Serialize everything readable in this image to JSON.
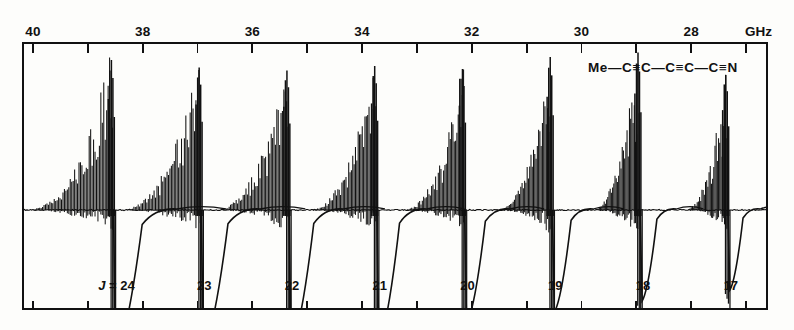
{
  "figure": {
    "kind": "microwave-rotational-spectrum",
    "species_formula": "Me—C≡C—C≡C—C≡N",
    "unit_label": "GHz",
    "j_prefix": "J =",
    "ink_color": "#111111",
    "background_color": "#fdfdfb"
  },
  "chart_data": {
    "type": "line",
    "title": "",
    "subtitle": "",
    "xlabel": "GHz",
    "ylabel": "",
    "grid": false,
    "legend": null,
    "annotations": [
      {
        "text": "Me—C≡C—C≡C—C≡N",
        "x": 28.6,
        "y": 0.9
      }
    ],
    "x_axis": {
      "orientation": "top",
      "direction": "decreasing",
      "range": [
        40.2,
        26.6
      ],
      "minor_tick_step": 1,
      "major_tick_step": 2,
      "tick_values": [
        40,
        39,
        38,
        37,
        36,
        35,
        34,
        33,
        32,
        31,
        30,
        29,
        28,
        27
      ],
      "labeled_ticks": [
        40,
        38,
        36,
        34,
        32,
        30,
        28
      ],
      "tick_labels": [
        "40",
        "38",
        "36",
        "34",
        "32",
        "30",
        "28"
      ]
    },
    "y_axis": {
      "range": [
        -1.15,
        1.05
      ],
      "ticks": [],
      "tick_labels": []
    },
    "bottom_axis": {
      "orientation": "bottom",
      "tick_values": [
        40,
        39,
        38,
        37,
        36,
        35,
        34,
        33,
        32,
        31,
        30,
        29,
        28,
        27
      ],
      "labels": [
        "24",
        "23",
        "22",
        "21",
        "20",
        "19",
        "18",
        "17",
        "16"
      ],
      "label_prefix_first": "J ="
    },
    "series": [
      {
        "name": "absorption trace",
        "description": "Nine J-transition clusters; each is a dense comb of K-structure lines rising to a tall peak followed by a sharp negative lobe.",
        "clusters": [
          {
            "j": 24,
            "label": "24",
            "center_ghz": 38.55,
            "peak_height": 1.0,
            "dip_depth": -1.05,
            "comb_width_ghz": 1.62,
            "n_lines": 62
          },
          {
            "j": 23,
            "label": "23",
            "center_ghz": 36.95,
            "peak_height": 0.95,
            "dip_depth": -1.0,
            "comb_width_ghz": 1.5,
            "n_lines": 58
          },
          {
            "j": 22,
            "label": "22",
            "center_ghz": 35.35,
            "peak_height": 0.93,
            "dip_depth": -0.98,
            "comb_width_ghz": 1.38,
            "n_lines": 55
          },
          {
            "j": 21,
            "label": "21",
            "center_ghz": 33.75,
            "peak_height": 0.96,
            "dip_depth": -0.95,
            "comb_width_ghz": 1.26,
            "n_lines": 52
          },
          {
            "j": 20,
            "label": "20",
            "center_ghz": 32.15,
            "peak_height": 0.94,
            "dip_depth": -0.82,
            "comb_width_ghz": 1.14,
            "n_lines": 48
          },
          {
            "j": 19,
            "label": "19",
            "center_ghz": 30.55,
            "peak_height": 1.02,
            "dip_depth": -0.74,
            "comb_width_ghz": 1.02,
            "n_lines": 45
          },
          {
            "j": 18,
            "label": "18",
            "center_ghz": 28.95,
            "peak_height": 1.05,
            "dip_depth": -0.66,
            "comb_width_ghz": 0.9,
            "n_lines": 42
          },
          {
            "j": 17,
            "label": "17",
            "center_ghz": 27.35,
            "peak_height": 0.9,
            "dip_depth": -0.58,
            "comb_width_ghz": 0.8,
            "n_lines": 38
          },
          {
            "j": 16,
            "label": "16",
            "center_ghz": 25.75,
            "peak_height": 0.86,
            "dip_depth": -0.4,
            "comb_width_ghz": 0.7,
            "n_lines": 34
          }
        ]
      }
    ]
  }
}
